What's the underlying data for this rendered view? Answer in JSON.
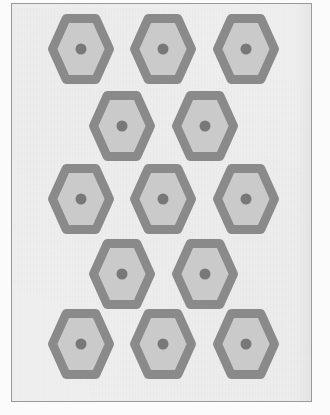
{
  "figure": {
    "title": "",
    "kind": "hexagonal-lattice-pattern",
    "shape_count": 13,
    "row_counts": [
      3,
      2,
      3,
      2,
      3
    ]
  },
  "colors": {
    "page_background": "#fbfbfb",
    "panel_background": "#efefef",
    "panel_border": "#9a9a9a",
    "hexagon_stroke": "#8a8a8a",
    "hexagon_fill": "#cacaca",
    "center_dot": "#787878"
  },
  "geometry": {
    "panel": {
      "x": 11,
      "y": 3,
      "width": 301,
      "height": 399,
      "border_width": 1.5
    },
    "hexagon": {
      "orientation": "flat-top",
      "outer_width": 66,
      "outer_height": 70,
      "stroke_width": 9,
      "dot_diameter": 11
    }
  },
  "hexagons": [
    {
      "id": "hex-r1-c1",
      "row": 1,
      "col": 1,
      "cx": 80,
      "cy": 48,
      "label": ""
    },
    {
      "id": "hex-r1-c2",
      "row": 1,
      "col": 2,
      "cx": 162,
      "cy": 48,
      "label": ""
    },
    {
      "id": "hex-r1-c3",
      "row": 1,
      "col": 3,
      "cx": 245,
      "cy": 48,
      "label": ""
    },
    {
      "id": "hex-r2-c1",
      "row": 2,
      "col": 1,
      "cx": 121,
      "cy": 125,
      "label": ""
    },
    {
      "id": "hex-r2-c2",
      "row": 2,
      "col": 2,
      "cx": 204,
      "cy": 125,
      "label": ""
    },
    {
      "id": "hex-r3-c1",
      "row": 3,
      "col": 1,
      "cx": 80,
      "cy": 198,
      "label": ""
    },
    {
      "id": "hex-r3-c2",
      "row": 3,
      "col": 2,
      "cx": 162,
      "cy": 198,
      "label": ""
    },
    {
      "id": "hex-r3-c3",
      "row": 3,
      "col": 3,
      "cx": 245,
      "cy": 198,
      "label": ""
    },
    {
      "id": "hex-r4-c1",
      "row": 4,
      "col": 1,
      "cx": 121,
      "cy": 273,
      "label": ""
    },
    {
      "id": "hex-r4-c2",
      "row": 4,
      "col": 2,
      "cx": 204,
      "cy": 273,
      "label": ""
    },
    {
      "id": "hex-r5-c1",
      "row": 5,
      "col": 1,
      "cx": 80,
      "cy": 343,
      "label": ""
    },
    {
      "id": "hex-r5-c2",
      "row": 5,
      "col": 2,
      "cx": 162,
      "cy": 343,
      "label": ""
    },
    {
      "id": "hex-r5-c3",
      "row": 5,
      "col": 3,
      "cx": 245,
      "cy": 343,
      "label": ""
    }
  ]
}
